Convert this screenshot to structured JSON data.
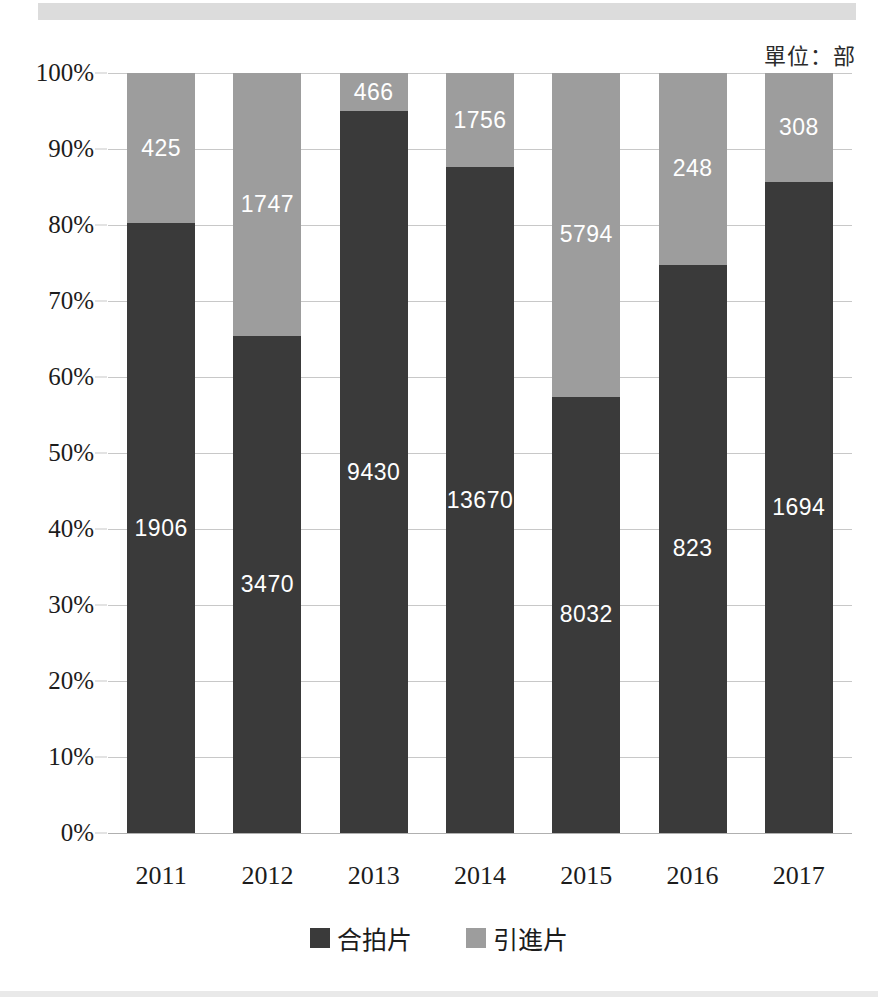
{
  "unit_label": "單位：部",
  "colors": {
    "dark": "#3a3a3a",
    "light": "#9d9d9d",
    "gridline": "#c8c8c8",
    "text": "#1c1c1c",
    "label_text": "#ffffff",
    "background": "#ffffff",
    "scan_banner": "#dcdcdc"
  },
  "legend": {
    "items": [
      {
        "label": "合拍片",
        "color": "#3a3a3a",
        "swatch": "dark"
      },
      {
        "label": "引進片",
        "color": "#9d9d9d",
        "swatch": "light"
      }
    ]
  },
  "yaxis": {
    "ticks": [
      "100%",
      "90%",
      "80%",
      "70%",
      "60%",
      "50%",
      "40%",
      "30%",
      "20%",
      "10%",
      "0%"
    ],
    "values": [
      100,
      90,
      80,
      70,
      60,
      50,
      40,
      30,
      20,
      10,
      0
    ],
    "min": 0,
    "max": 100
  },
  "chart_data": {
    "type": "bar",
    "subtype": "stacked-100-percent",
    "title": "",
    "subtitle": "",
    "xlabel": "",
    "ylabel": "",
    "unit_note": "單位：部",
    "ylim": [
      0,
      100
    ],
    "ytick_labels": [
      "0%",
      "10%",
      "20%",
      "30%",
      "40%",
      "50%",
      "60%",
      "70%",
      "80%",
      "90%",
      "100%"
    ],
    "grid": true,
    "legend_position": "bottom-center",
    "categories": [
      "2011",
      "2012",
      "2013",
      "2014",
      "2015",
      "2016",
      "2017"
    ],
    "series": [
      {
        "name": "合拍片",
        "color": "#3a3a3a",
        "values": [
          1906,
          3470,
          9430,
          13670,
          8032,
          823,
          1694
        ],
        "percent": [
          80.2,
          65.4,
          95.0,
          87.6,
          57.4,
          74.8,
          85.7
        ]
      },
      {
        "name": "引進片",
        "color": "#9d9d9d",
        "values": [
          425,
          1747,
          466,
          1756,
          5794,
          248,
          308
        ],
        "percent": [
          19.8,
          34.6,
          5.0,
          12.4,
          42.6,
          25.2,
          14.3
        ]
      }
    ],
    "totals": [
      2331,
      5217,
      9896,
      15426,
      13826,
      1071,
      2002
    ]
  }
}
